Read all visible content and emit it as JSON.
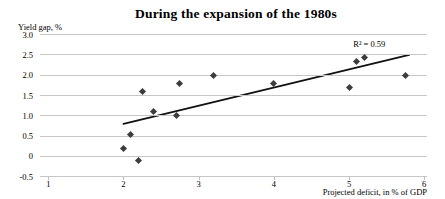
{
  "colors": {
    "background": "#ffffff",
    "text": "#000000",
    "gridline": "#c6c6c6",
    "marker": "#3d3d3d",
    "trendline": "#111111"
  },
  "chart_data": {
    "type": "scatter",
    "title": "During the expansion of the 1980s",
    "xlabel": "Projected deficit, in % of GDP",
    "ylabel": "Yield gap, %",
    "xlim": [
      1,
      6
    ],
    "ylim": [
      -0.5,
      3.0
    ],
    "grid": "horizontal",
    "legend": "none",
    "x_ticks": [
      {
        "value": 1,
        "label": "1"
      },
      {
        "value": 2,
        "label": "2"
      },
      {
        "value": 3,
        "label": "3"
      },
      {
        "value": 4,
        "label": "4"
      },
      {
        "value": 5,
        "label": "5"
      },
      {
        "value": 6,
        "label": "6"
      }
    ],
    "y_ticks": [
      {
        "value": 3.0,
        "label": "3.0"
      },
      {
        "value": 2.5,
        "label": "2.5"
      },
      {
        "value": 2.0,
        "label": "2.0"
      },
      {
        "value": 1.5,
        "label": "1.5"
      },
      {
        "value": 1.0,
        "label": "1.0"
      },
      {
        "value": 0.5,
        "label": "0.5"
      },
      {
        "value": 0,
        "label": "0"
      },
      {
        "value": -0.5,
        "label": "-0.5"
      }
    ],
    "points": [
      {
        "x": 2.0,
        "y": 0.2
      },
      {
        "x": 2.1,
        "y": 0.55
      },
      {
        "x": 2.2,
        "y": -0.1
      },
      {
        "x": 2.25,
        "y": 1.6
      },
      {
        "x": 2.4,
        "y": 1.1
      },
      {
        "x": 2.7,
        "y": 1.0
      },
      {
        "x": 2.75,
        "y": 1.8
      },
      {
        "x": 3.2,
        "y": 2.0
      },
      {
        "x": 4.0,
        "y": 1.8
      },
      {
        "x": 5.0,
        "y": 1.7
      },
      {
        "x": 5.1,
        "y": 2.35
      },
      {
        "x": 5.2,
        "y": 2.45
      },
      {
        "x": 5.75,
        "y": 2.0
      }
    ],
    "trendline": {
      "x1": 2.0,
      "y1": 0.8,
      "x2": 5.8,
      "y2": 2.5
    },
    "annotation": {
      "text": "R² = 0.59",
      "x": 5.27,
      "y": 2.78
    }
  }
}
